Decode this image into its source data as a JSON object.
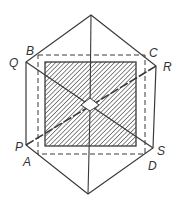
{
  "diagram": {
    "type": "hexagonal prism projection with shaded square cross-section",
    "colors": {
      "stroke": "#3a3a3a",
      "hatch": "#3a3a3a",
      "background": "#ffffff"
    },
    "labels": [
      {
        "id": "B",
        "text": "B",
        "x": 26,
        "y": 55
      },
      {
        "id": "Q",
        "text": "Q",
        "x": 9,
        "y": 67
      },
      {
        "id": "C",
        "text": "C",
        "x": 149,
        "y": 57
      },
      {
        "id": "R",
        "text": "R",
        "x": 163,
        "y": 71
      },
      {
        "id": "P",
        "text": "P",
        "x": 15,
        "y": 151
      },
      {
        "id": "A",
        "text": "A",
        "x": 23,
        "y": 166
      },
      {
        "id": "S",
        "text": "S",
        "x": 157,
        "y": 155
      },
      {
        "id": "D",
        "text": "D",
        "x": 148,
        "y": 170
      }
    ]
  }
}
